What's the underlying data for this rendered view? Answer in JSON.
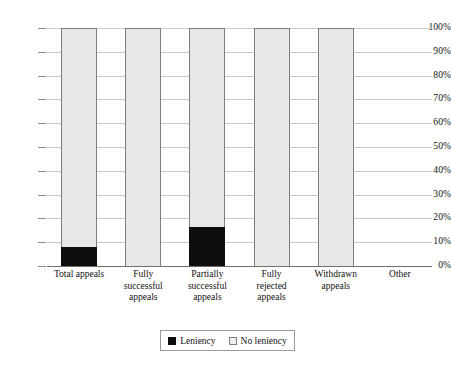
{
  "chart_data": {
    "type": "bar",
    "stacked": true,
    "stack_mode": "percent",
    "title": "",
    "subtitle": "",
    "xlabel": "",
    "ylabel": "",
    "ylim": [
      0,
      100
    ],
    "ytick_labels": [
      "100%",
      "90%",
      "80%",
      "70%",
      "60%",
      "50%",
      "40%",
      "30%",
      "20%",
      "10%",
      "0%"
    ],
    "ytick_values": [
      100,
      90,
      80,
      70,
      60,
      50,
      40,
      30,
      20,
      10,
      0
    ],
    "grid": true,
    "grid_axis": "y",
    "legend_position": "bottom",
    "categories": [
      "Total appeals",
      "Fully successful appeals",
      "Partially successful appeals",
      "Fully rejected appeals",
      "Withdrawn appeals",
      "Other"
    ],
    "category_lines": [
      [
        "Total appeals"
      ],
      [
        "Fully",
        "successful",
        "appeals"
      ],
      [
        "Partially",
        "successful",
        "appeals"
      ],
      [
        "Fully",
        "rejected",
        "appeals"
      ],
      [
        "Withdrawn",
        "appeals"
      ],
      [
        "Other"
      ]
    ],
    "series": [
      {
        "name": "Leniency",
        "color": "#0d0d0d",
        "values": [
          8,
          0,
          16.5,
          0,
          0,
          0
        ]
      },
      {
        "name": "No leniency",
        "color": "#e7e7e7",
        "values": [
          92,
          100,
          83.5,
          100,
          100,
          0
        ]
      }
    ],
    "bar_totals": [
      100,
      100,
      100,
      100,
      100,
      0
    ]
  },
  "legend": {
    "items": [
      {
        "label": "Leniency",
        "swatch": "leniency"
      },
      {
        "label": "No leniency",
        "swatch": "no-leniency"
      }
    ]
  },
  "colors": {
    "leniency": "#0d0d0d",
    "no_leniency": "#e7e7e7",
    "gridline": "#c9c9c9",
    "axis": "#6e6e6e",
    "bar_border": "#7d7d7d",
    "text": "#111111",
    "background": "#ffffff"
  }
}
